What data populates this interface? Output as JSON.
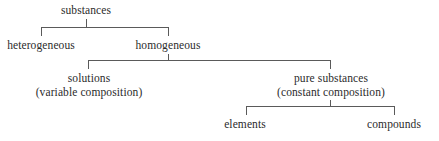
{
  "diagram": {
    "type": "hierarchy-tree",
    "line_color": "#5a5a5a",
    "text_color": "#2b2b2b",
    "background": "#ffffff",
    "nodes": {
      "root": {
        "label": "substances"
      },
      "heterogeneous": {
        "label": "heterogeneous"
      },
      "homogeneous": {
        "label": "homogeneous"
      },
      "solutions": {
        "label": "solutions",
        "note": "(variable composition)"
      },
      "pure_substances": {
        "label": "pure substances",
        "note": "(constant composition)"
      },
      "elements": {
        "label": "elements"
      },
      "compounds": {
        "label": "compounds"
      }
    },
    "edges": [
      {
        "from": "root",
        "to": "heterogeneous"
      },
      {
        "from": "root",
        "to": "homogeneous"
      },
      {
        "from": "homogeneous",
        "to": "solutions"
      },
      {
        "from": "homogeneous",
        "to": "pure_substances"
      },
      {
        "from": "pure_substances",
        "to": "elements"
      },
      {
        "from": "pure_substances",
        "to": "compounds"
      }
    ]
  }
}
